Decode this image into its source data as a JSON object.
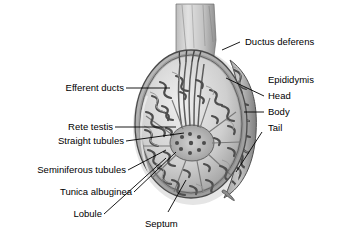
{
  "figure": {
    "background_color": "#ffffff",
    "label_color": "#000000",
    "leader_line_color": "#000000",
    "illustration": {
      "name": "testis-sagittal-section",
      "style": "grayscale halftone anatomical illustration",
      "palette": {
        "outline": "#3a3a3a",
        "dark_tissue": "#5a5a5a",
        "mid_tissue": "#8c8c8c",
        "light_tissue": "#c9c9c9",
        "highlight": "#e6e6e6",
        "shadow": "#6d6d6d",
        "vessel_dot": "#2b2b2b"
      }
    }
  },
  "labels": {
    "left": [
      {
        "id": "efferent-ducts",
        "text": "Efferent ducts"
      },
      {
        "id": "rete-testis",
        "text": "Rete testis"
      },
      {
        "id": "straight-tubules",
        "text": "Straight tubules"
      },
      {
        "id": "seminiferous-tubules",
        "text": "Seminiferous tubules"
      },
      {
        "id": "tunica-albuginea",
        "text": "Tunica albuginea"
      },
      {
        "id": "lobule",
        "text": "Lobule"
      }
    ],
    "bottom": [
      {
        "id": "septum",
        "text": "Septum"
      }
    ],
    "right": [
      {
        "id": "ductus-deferens",
        "text": "Ductus deferens"
      },
      {
        "id": "epididymis",
        "text": "Epididymis"
      },
      {
        "id": "head",
        "text": "Head"
      },
      {
        "id": "body",
        "text": "Body"
      },
      {
        "id": "tail",
        "text": "Tail"
      }
    ]
  }
}
